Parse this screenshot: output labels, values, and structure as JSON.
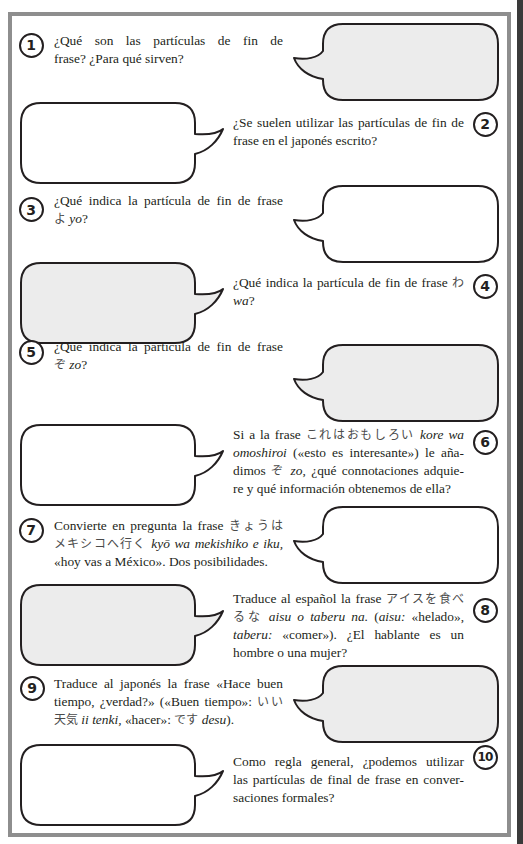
{
  "colors": {
    "text": "#231f20",
    "frame": "#8e8e8e",
    "edge_strip": "#3a3a3a",
    "bubble_stroke": "#231f20",
    "bubble_gray": "#ececec",
    "bubble_white": "#ffffff"
  },
  "questions": [
    {
      "number": "1",
      "badge_side": "left",
      "bubble_side": "right",
      "bubble_fill": "#ececec",
      "lines": [
        [
          {
            "t": "¿Qué son las partículas de fin de"
          }
        ],
        [
          {
            "t": "frase? ¿Para qué sirven?"
          }
        ]
      ]
    },
    {
      "number": "2",
      "badge_side": "right",
      "bubble_side": "left",
      "bubble_fill": "#ffffff",
      "lines": [
        [
          {
            "t": "¿Se suelen utilizar las partículas de fin de"
          }
        ],
        [
          {
            "t": "frase en el japonés escrito?"
          }
        ]
      ]
    },
    {
      "number": "3",
      "badge_side": "left",
      "bubble_side": "right",
      "bubble_fill": "#ffffff",
      "lines": [
        [
          {
            "t": "¿Qué indica la partícula de fin de frase"
          }
        ],
        [
          {
            "t": "よ",
            "jp": true
          },
          {
            "t": " "
          },
          {
            "t": "yo",
            "i": true
          },
          {
            "t": "?"
          }
        ]
      ]
    },
    {
      "number": "4",
      "badge_side": "right",
      "bubble_side": "left",
      "bubble_fill": "#ececec",
      "lines": [
        [
          {
            "t": "¿Qué indica la partícula de fin de frase "
          },
          {
            "t": "わ",
            "jp": true
          }
        ],
        [
          {
            "t": "wa",
            "i": true
          },
          {
            "t": "?"
          }
        ]
      ]
    },
    {
      "number": "5",
      "badge_side": "left",
      "bubble_side": "right",
      "bubble_fill": "#ececec",
      "lines": [
        [
          {
            "t": "¿Qué indica la partícula de fin de frase"
          }
        ],
        [
          {
            "t": "ぞ",
            "jp": true
          },
          {
            "t": " "
          },
          {
            "t": "zo",
            "i": true
          },
          {
            "t": "?"
          }
        ]
      ]
    },
    {
      "number": "6",
      "badge_side": "right",
      "bubble_side": "left",
      "bubble_fill": "#ffffff",
      "lines": [
        [
          {
            "t": "Si a la frase "
          },
          {
            "t": "これはおもしろい",
            "jp": true
          },
          {
            "t": " "
          },
          {
            "t": "kore wa",
            "i": true
          }
        ],
        [
          {
            "t": "omoshiroi",
            "i": true
          },
          {
            "t": " («esto es interesante») le aña-"
          }
        ],
        [
          {
            "t": "dimos "
          },
          {
            "t": "ぞ",
            "jp": true
          },
          {
            "t": " "
          },
          {
            "t": "zo",
            "i": true
          },
          {
            "t": ", ¿qué connotaciones adquie-"
          }
        ],
        [
          {
            "t": "re y qué información obtenemos de ella?"
          }
        ]
      ]
    },
    {
      "number": "7",
      "badge_side": "left",
      "bubble_side": "right",
      "bubble_fill": "#ffffff",
      "lines": [
        [
          {
            "t": "Convierte en pregunta la frase "
          },
          {
            "t": "きょうは",
            "jp": true
          }
        ],
        [
          {
            "t": "メキシコへ行く",
            "jp": true
          },
          {
            "t": " "
          },
          {
            "t": "kyō wa mekishiko e iku,",
            "i": true
          }
        ],
        [
          {
            "t": "«hoy vas a México». Dos posibilidades."
          }
        ]
      ]
    },
    {
      "number": "8",
      "badge_side": "right",
      "bubble_side": "left",
      "bubble_fill": "#ececec",
      "lines": [
        [
          {
            "t": "Traduce al español la frase "
          },
          {
            "t": "アイスを食べ",
            "jp": true
          }
        ],
        [
          {
            "t": "るな",
            "jp": true
          },
          {
            "t": " "
          },
          {
            "t": "aisu o taberu na.",
            "i": true
          },
          {
            "t": " ("
          },
          {
            "t": "aisu:",
            "i": true
          },
          {
            "t": " «helado»,"
          }
        ],
        [
          {
            "t": "taberu:",
            "i": true
          },
          {
            "t": " «comer»). ¿El hablante es un"
          }
        ],
        [
          {
            "t": "hombre o una mujer?"
          }
        ]
      ]
    },
    {
      "number": "9",
      "badge_side": "left",
      "bubble_side": "right",
      "bubble_fill": "#ececec",
      "lines": [
        [
          {
            "t": "Traduce al japonés la frase «Hace buen"
          }
        ],
        [
          {
            "t": "tiempo, ¿verdad?» («Buen tiempo»: "
          },
          {
            "t": "いい",
            "jp": true
          }
        ],
        [
          {
            "t": "天気",
            "jp": true
          },
          {
            "t": " "
          },
          {
            "t": "ii tenki,",
            "i": true
          },
          {
            "t": " «hacer»: "
          },
          {
            "t": "です",
            "jp": true
          },
          {
            "t": " "
          },
          {
            "t": "desu",
            "i": true
          },
          {
            "t": ")."
          }
        ]
      ]
    },
    {
      "number": "10",
      "badge_side": "right",
      "bubble_side": "left",
      "bubble_fill": "#ffffff",
      "lines": [
        [
          {
            "t": "Como regla general, ¿podemos utilizar"
          }
        ],
        [
          {
            "t": "las partículas de final de frase en conver-"
          }
        ],
        [
          {
            "t": "saciones formales?"
          }
        ]
      ]
    }
  ]
}
